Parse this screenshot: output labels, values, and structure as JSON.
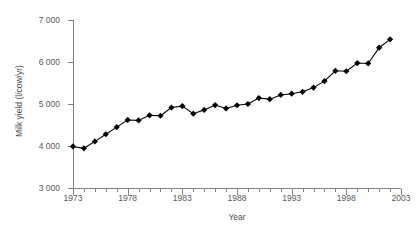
{
  "chart_data": {
    "type": "line",
    "title": "",
    "xlabel": "Year",
    "ylabel": "Milk yield (l/cow/yr)",
    "xlim": [
      1973,
      2003
    ],
    "ylim": [
      3000,
      7000
    ],
    "y_ticks": [
      3000,
      4000,
      5000,
      6000,
      7000
    ],
    "y_tick_labels": [
      "3 000",
      "4 000",
      "5 000",
      "6 000",
      "7 000"
    ],
    "x_ticks": [
      1973,
      1978,
      1983,
      1988,
      1993,
      1998,
      2003
    ],
    "x_tick_labels": [
      "1973",
      "1978",
      "1983",
      "1988",
      "1993",
      "1998",
      "2003"
    ],
    "x_minor_tick_interval": 1,
    "grid": false,
    "legend": false,
    "marker": "diamond",
    "line_color": "#000000",
    "marker_color": "#000000",
    "axis_color": "#808080",
    "background_color": "#ffffff",
    "x": [
      1973,
      1974,
      1975,
      1976,
      1977,
      1978,
      1979,
      1980,
      1981,
      1982,
      1983,
      1984,
      1985,
      1986,
      1987,
      1988,
      1989,
      1990,
      1991,
      1992,
      1993,
      1994,
      1995,
      1996,
      1997,
      1998,
      1999,
      2000,
      2001,
      2002
    ],
    "values": [
      3990,
      3945,
      4110,
      4280,
      4450,
      4620,
      4610,
      4730,
      4720,
      4915,
      4950,
      4770,
      4860,
      4975,
      4895,
      4970,
      5000,
      5140,
      5115,
      5215,
      5245,
      5290,
      5390,
      5545,
      5790,
      5780,
      5975,
      5965,
      6340,
      6540
    ],
    "series": [
      {
        "name": "Milk yield",
        "values": [
          3990,
          3945,
          4110,
          4280,
          4450,
          4620,
          4610,
          4730,
          4720,
          4915,
          4950,
          4770,
          4860,
          4975,
          4895,
          4970,
          5000,
          5140,
          5115,
          5215,
          5245,
          5290,
          5390,
          5545,
          5790,
          5780,
          5975,
          5965,
          6340,
          6540
        ]
      }
    ]
  }
}
